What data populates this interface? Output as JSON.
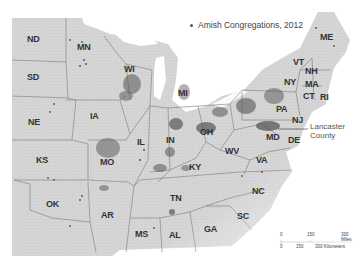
{
  "legend": {
    "marker": "dot",
    "label": "Amish Congregations, 2012"
  },
  "callout": {
    "line1": "Lancaster",
    "line2": "County"
  },
  "scale": {
    "miles_ticks": [
      "0",
      "150",
      "300 Miles"
    ],
    "km_ticks": [
      "0",
      "150",
      "300 Kilometers"
    ]
  },
  "states": [
    {
      "abbr": "ND",
      "x": 33,
      "y": 40
    },
    {
      "abbr": "MN",
      "x": 83,
      "y": 48
    },
    {
      "abbr": "SD",
      "x": 33,
      "y": 78
    },
    {
      "abbr": "WI",
      "x": 130,
      "y": 70
    },
    {
      "abbr": "MI",
      "x": 184,
      "y": 94
    },
    {
      "abbr": "NE",
      "x": 34,
      "y": 123
    },
    {
      "abbr": "IA",
      "x": 96,
      "y": 117
    },
    {
      "abbr": "IL",
      "x": 143,
      "y": 143
    },
    {
      "abbr": "IN",
      "x": 172,
      "y": 141
    },
    {
      "abbr": "OH",
      "x": 206,
      "y": 133
    },
    {
      "abbr": "KS",
      "x": 42,
      "y": 161
    },
    {
      "abbr": "MO",
      "x": 106,
      "y": 163
    },
    {
      "abbr": "KY",
      "x": 195,
      "y": 168
    },
    {
      "abbr": "WV",
      "x": 231,
      "y": 152
    },
    {
      "abbr": "VA",
      "x": 262,
      "y": 161
    },
    {
      "abbr": "OK",
      "x": 52,
      "y": 205
    },
    {
      "abbr": "AR",
      "x": 107,
      "y": 216
    },
    {
      "abbr": "TN",
      "x": 176,
      "y": 199
    },
    {
      "abbr": "NC",
      "x": 258,
      "y": 192
    },
    {
      "abbr": "SC",
      "x": 243,
      "y": 217
    },
    {
      "abbr": "MS",
      "x": 141,
      "y": 235
    },
    {
      "abbr": "AL",
      "x": 175,
      "y": 236
    },
    {
      "abbr": "GA",
      "x": 210,
      "y": 230
    },
    {
      "abbr": "ME",
      "x": 326,
      "y": 38
    },
    {
      "abbr": "VT",
      "x": 299,
      "y": 63
    },
    {
      "abbr": "NH",
      "x": 311,
      "y": 72
    },
    {
      "abbr": "NY",
      "x": 290,
      "y": 83
    },
    {
      "abbr": "MA",
      "x": 311,
      "y": 85
    },
    {
      "abbr": "CT",
      "x": 309,
      "y": 97
    },
    {
      "abbr": "RI",
      "x": 326,
      "y": 98
    },
    {
      "abbr": "PA",
      "x": 282,
      "y": 110
    },
    {
      "abbr": "NJ",
      "x": 298,
      "y": 121
    },
    {
      "abbr": "MD",
      "x": 272,
      "y": 138
    },
    {
      "abbr": "DE",
      "x": 294,
      "y": 141
    }
  ],
  "colors": {
    "land": "#d6d6d6",
    "border": "#7a7a7a",
    "dots": "#555555",
    "water": "#ffffff"
  }
}
